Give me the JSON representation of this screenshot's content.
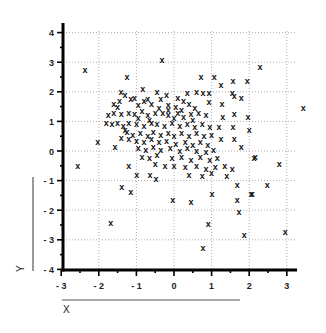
{
  "chart_data": {
    "type": "scatter",
    "title": "",
    "xlabel": "X",
    "ylabel": "Y",
    "xlim": [
      -3,
      3.4
    ],
    "ylim": [
      -4,
      4.3
    ],
    "grid": true,
    "marker": "x",
    "x_ticks": [
      -3,
      -2,
      -1,
      0,
      1,
      2,
      3
    ],
    "y_ticks": [
      -4,
      -3,
      -2,
      -1,
      0,
      1,
      2,
      3,
      4
    ],
    "x_tick_labels": [
      "-3",
      "-2",
      "-1",
      "0",
      "1",
      "2",
      "3"
    ],
    "y_tick_labels": [
      "-4",
      "-3",
      "-2",
      "-1",
      "0",
      "1",
      "2",
      "3",
      "4"
    ],
    "points": [
      [
        -2.37,
        2.73
      ],
      [
        -0.32,
        3.06
      ],
      [
        -1.25,
        2.5
      ],
      [
        -1.41,
        2.0
      ],
      [
        -0.83,
        2.1
      ],
      [
        -0.45,
        2.0
      ],
      [
        2.29,
        2.83
      ],
      [
        0.72,
        2.49
      ],
      [
        1.07,
        2.49
      ],
      [
        1.25,
        2.22
      ],
      [
        1.57,
        2.36
      ],
      [
        1.95,
        2.36
      ],
      [
        0.6,
        2.0
      ],
      [
        0.77,
        1.95
      ],
      [
        0.93,
        1.95
      ],
      [
        1.55,
        1.95
      ],
      [
        1.6,
        1.85
      ],
      [
        1.79,
        1.8
      ],
      [
        0.93,
        1.65
      ],
      [
        1.28,
        1.58
      ],
      [
        1.6,
        1.25
      ],
      [
        1.3,
        1.15
      ],
      [
        1.97,
        1.14
      ],
      [
        2.0,
        0.7
      ],
      [
        1.57,
        0.8
      ],
      [
        1.2,
        0.8
      ],
      [
        1.25,
        0.4
      ],
      [
        1.6,
        0.4
      ],
      [
        1.79,
        0.14
      ],
      [
        2.16,
        -0.2
      ],
      [
        3.44,
        1.45
      ],
      [
        2.8,
        -0.44
      ],
      [
        2.48,
        -1.15
      ],
      [
        2.13,
        -0.24
      ],
      [
        2.05,
        -1.45
      ],
      [
        -2.56,
        -0.5
      ],
      [
        -2.03,
        0.3
      ],
      [
        -1.57,
        0.13
      ],
      [
        -1.2,
        -0.5
      ],
      [
        -0.99,
        -0.8
      ],
      [
        -0.64,
        -0.8
      ],
      [
        -0.48,
        -0.94
      ],
      [
        -1.39,
        -1.2
      ],
      [
        -1.15,
        -1.4
      ],
      [
        -1.68,
        -2.42
      ],
      [
        -0.03,
        -1.65
      ],
      [
        -0.24,
        -0.5
      ],
      [
        0.45,
        -1.72
      ],
      [
        1.01,
        -1.45
      ],
      [
        1.68,
        -1.65
      ],
      [
        1.73,
        -2.05
      ],
      [
        0.91,
        -2.46
      ],
      [
        1.87,
        -2.83
      ],
      [
        2.96,
        -2.73
      ],
      [
        0.77,
        -3.27
      ],
      [
        2.08,
        -1.45
      ],
      [
        1.68,
        -1.15
      ],
      [
        -1.6,
        1.6
      ],
      [
        -1.45,
        1.7
      ],
      [
        -1.15,
        1.75
      ],
      [
        -1.05,
        1.8
      ],
      [
        -0.8,
        1.7
      ],
      [
        -0.6,
        1.6
      ],
      [
        -0.35,
        1.75
      ],
      [
        -0.15,
        1.55
      ],
      [
        0.05,
        1.5
      ],
      [
        0.25,
        1.7
      ],
      [
        0.4,
        1.6
      ],
      [
        0.55,
        1.45
      ],
      [
        -1.75,
        1.2
      ],
      [
        -1.6,
        1.3
      ],
      [
        -1.4,
        1.25
      ],
      [
        -1.2,
        1.3
      ],
      [
        -1.05,
        1.25
      ],
      [
        -0.85,
        1.35
      ],
      [
        -0.7,
        1.2
      ],
      [
        -0.5,
        1.3
      ],
      [
        -0.3,
        1.3
      ],
      [
        -0.15,
        1.2
      ],
      [
        0.1,
        1.3
      ],
      [
        0.25,
        1.15
      ],
      [
        0.45,
        1.25
      ],
      [
        0.65,
        1.3
      ],
      [
        0.85,
        1.2
      ],
      [
        -1.8,
        0.95
      ],
      [
        -1.65,
        0.9
      ],
      [
        -1.5,
        0.95
      ],
      [
        -1.35,
        0.85
      ],
      [
        -1.2,
        0.95
      ],
      [
        -1.0,
        0.9
      ],
      [
        -0.8,
        0.85
      ],
      [
        -0.6,
        0.95
      ],
      [
        -0.45,
        0.9
      ],
      [
        -0.25,
        0.85
      ],
      [
        -0.05,
        0.95
      ],
      [
        0.15,
        0.85
      ],
      [
        0.35,
        0.9
      ],
      [
        0.55,
        0.8
      ],
      [
        0.75,
        0.9
      ],
      [
        0.95,
        0.8
      ],
      [
        -1.25,
        0.65
      ],
      [
        -1.1,
        0.55
      ],
      [
        -0.9,
        0.6
      ],
      [
        -0.7,
        0.5
      ],
      [
        -0.55,
        0.65
      ],
      [
        -0.35,
        0.55
      ],
      [
        -0.15,
        0.6
      ],
      [
        0.0,
        0.5
      ],
      [
        0.2,
        0.6
      ],
      [
        0.4,
        0.5
      ],
      [
        0.6,
        0.6
      ],
      [
        0.8,
        0.5
      ],
      [
        1.0,
        0.55
      ],
      [
        -1.4,
        0.45
      ],
      [
        -1.2,
        0.4
      ],
      [
        -1.0,
        0.35
      ],
      [
        -0.8,
        0.3
      ],
      [
        -0.6,
        0.4
      ],
      [
        -0.4,
        0.3
      ],
      [
        -0.2,
        0.35
      ],
      [
        0.05,
        0.25
      ],
      [
        0.3,
        0.3
      ],
      [
        0.5,
        0.2
      ],
      [
        0.7,
        0.3
      ],
      [
        0.9,
        0.2
      ],
      [
        -0.95,
        0.1
      ],
      [
        -0.75,
        0.05
      ],
      [
        -0.55,
        0.15
      ],
      [
        -0.35,
        0.05
      ],
      [
        -0.1,
        0.1
      ],
      [
        0.15,
        0.0
      ],
      [
        0.35,
        0.1
      ],
      [
        0.6,
        0.0
      ],
      [
        0.85,
        -0.05
      ],
      [
        1.05,
        0.05
      ],
      [
        -0.85,
        -0.2
      ],
      [
        -0.65,
        -0.25
      ],
      [
        -0.45,
        -0.15
      ],
      [
        -0.05,
        -0.25
      ],
      [
        0.2,
        -0.2
      ],
      [
        0.45,
        -0.3
      ],
      [
        0.7,
        -0.2
      ],
      [
        0.95,
        -0.3
      ],
      [
        1.15,
        -0.25
      ],
      [
        -0.5,
        -0.45
      ],
      [
        0.0,
        -0.5
      ],
      [
        0.3,
        -0.55
      ],
      [
        0.6,
        -0.5
      ],
      [
        0.85,
        -0.6
      ],
      [
        1.1,
        -0.55
      ],
      [
        1.35,
        -0.5
      ],
      [
        0.4,
        -0.8
      ],
      [
        0.75,
        -0.85
      ],
      [
        1.0,
        -0.75
      ],
      [
        1.4,
        -0.85
      ],
      [
        1.55,
        -0.6
      ],
      [
        -1.5,
        1.5
      ],
      [
        -1.3,
        1.9
      ],
      [
        -0.95,
        1.55
      ],
      [
        -0.7,
        1.75
      ],
      [
        -0.4,
        1.45
      ],
      [
        -0.2,
        1.9
      ],
      [
        0.1,
        1.8
      ],
      [
        0.35,
        1.95
      ],
      [
        -0.15,
        1.4
      ],
      [
        0.2,
        1.4
      ],
      [
        0.5,
        1.05
      ],
      [
        -0.65,
        1.05
      ],
      [
        -0.95,
        1.1
      ],
      [
        0.0,
        1.1
      ],
      [
        -1.3,
        0.7
      ]
    ]
  },
  "axes": {
    "x_title": "X",
    "y_title": "Y"
  }
}
